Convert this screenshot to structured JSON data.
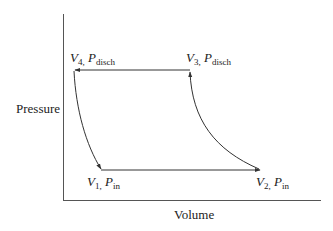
{
  "diagram": {
    "type": "pressure-volume cycle",
    "axes": {
      "y_label": "Pressure",
      "x_label": "Volume"
    },
    "points": [
      {
        "id": "V1",
        "var": "V",
        "var_sub": "1,",
        "p": "P",
        "p_sub": "in"
      },
      {
        "id": "V2",
        "var": "V",
        "var_sub": "2,",
        "p": "P",
        "p_sub": "in"
      },
      {
        "id": "V3",
        "var": "V",
        "var_sub": "3,",
        "p": "P",
        "p_sub": "disch"
      },
      {
        "id": "V4",
        "var": "V",
        "var_sub": "4,",
        "p": "P",
        "p_sub": "disch"
      }
    ],
    "paths": [
      {
        "from": "V1",
        "to": "V2",
        "kind": "constant-pressure intake",
        "shape": "straight"
      },
      {
        "from": "V2",
        "to": "V3",
        "kind": "compression",
        "shape": "curve"
      },
      {
        "from": "V3",
        "to": "V4",
        "kind": "constant-pressure discharge",
        "shape": "straight"
      },
      {
        "from": "V4",
        "to": "V1",
        "kind": "expansion",
        "shape": "curve"
      }
    ],
    "colors": {
      "line": "#333333",
      "axis": "#555555",
      "text": "#222222"
    }
  }
}
